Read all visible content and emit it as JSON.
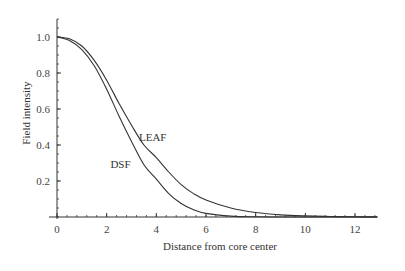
{
  "chart_data": {
    "type": "line",
    "title": "",
    "xlabel": "Distance from core center",
    "ylabel": "Field intensity",
    "xlim": [
      0,
      12.9
    ],
    "ylim": [
      0,
      1.1
    ],
    "xticks": [
      0,
      2,
      4,
      6,
      8,
      10,
      12
    ],
    "xtick_labels": [
      "0",
      "2",
      "4",
      "6",
      "8",
      "10",
      "12"
    ],
    "yticks": [
      0.2,
      0.4,
      0.6,
      0.8,
      1.0
    ],
    "ytick_labels": [
      "0.2",
      "0.4",
      "0.6",
      "0.8",
      "1.0"
    ],
    "x_minor_step": 0.4,
    "y_minor_step": 0.05,
    "grid": false,
    "legend": "inline labels",
    "series": [
      {
        "name": "LEAF",
        "label_pos": [
          3.3,
          0.42
        ],
        "x": [
          0,
          0.5,
          1,
          1.5,
          2,
          2.5,
          3,
          3.5,
          4,
          4.5,
          5,
          5.5,
          6,
          7,
          8,
          9,
          10,
          11,
          12,
          12.9
        ],
        "values": [
          1.0,
          0.99,
          0.95,
          0.87,
          0.76,
          0.63,
          0.51,
          0.4,
          0.33,
          0.25,
          0.18,
          0.13,
          0.095,
          0.05,
          0.025,
          0.012,
          0.006,
          0.003,
          0.001,
          0.0005
        ]
      },
      {
        "name": "DSF",
        "label_pos": [
          2.15,
          0.27
        ],
        "x": [
          0,
          0.5,
          1,
          1.5,
          2,
          2.5,
          3,
          3.5,
          4,
          4.5,
          5,
          5.5,
          6,
          7,
          8,
          9,
          10,
          12,
          12.9
        ],
        "values": [
          1.0,
          0.98,
          0.93,
          0.84,
          0.71,
          0.56,
          0.42,
          0.29,
          0.21,
          0.13,
          0.075,
          0.04,
          0.02,
          0.005,
          0.001,
          0.0003,
          0.0001,
          0,
          0
        ]
      }
    ]
  },
  "colors": {
    "line": "#333333",
    "axis": "#333333"
  }
}
